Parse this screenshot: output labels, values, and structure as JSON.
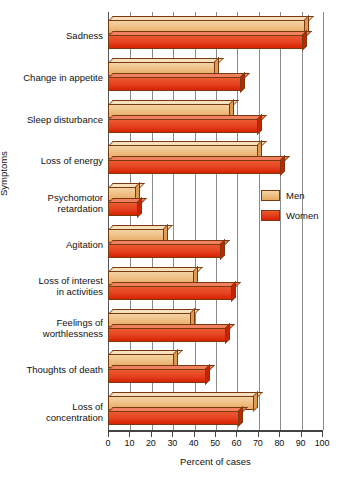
{
  "chart_data": {
    "type": "bar",
    "orientation": "horizontal",
    "title": "",
    "xlabel": "Percent of cases",
    "ylabel": "Symptoms",
    "xlim": [
      0,
      100
    ],
    "xticks": [
      "0",
      "10",
      "20",
      "30",
      "40",
      "50",
      "60",
      "70",
      "80",
      "90",
      "100"
    ],
    "grid": true,
    "legend_position": "middle-right",
    "categories": [
      "Sadness",
      "Change in appetite",
      "Sleep disturbance",
      "Loss of energy",
      "Psychomotor retardation",
      "Agitation",
      "Loss of interest in activities",
      "Feelings of worthlessness",
      "Thoughts of death",
      "Loss of concentration"
    ],
    "series": [
      {
        "name": "Men",
        "color": "#EDBB82",
        "values": [
          92,
          50,
          57,
          70,
          13,
          26,
          40,
          39,
          31,
          68
        ]
      },
      {
        "name": "Women",
        "color": "#E5401F",
        "values": [
          91,
          62,
          70,
          81,
          14,
          53,
          58,
          55,
          46,
          61
        ]
      }
    ]
  },
  "axes": {
    "x_title": "Percent of cases",
    "y_title": "Symptoms"
  },
  "category_labels": [
    {
      "lines": [
        "Sadness"
      ]
    },
    {
      "lines": [
        "Change in appetite"
      ]
    },
    {
      "lines": [
        "Sleep disturbance"
      ]
    },
    {
      "lines": [
        "Loss of energy"
      ]
    },
    {
      "lines": [
        "Psychomotor",
        "retardation"
      ]
    },
    {
      "lines": [
        "Agitation"
      ]
    },
    {
      "lines": [
        "Loss of interest",
        "in activities"
      ]
    },
    {
      "lines": [
        "Feelings of",
        "worthlessness"
      ]
    },
    {
      "lines": [
        "Thoughts of death"
      ]
    },
    {
      "lines": [
        "Loss of",
        "concentration"
      ]
    }
  ],
  "legend": {
    "items": [
      {
        "label": "Men",
        "color": "#EDBB82"
      },
      {
        "label": "Women",
        "color": "#E5401F"
      }
    ]
  }
}
